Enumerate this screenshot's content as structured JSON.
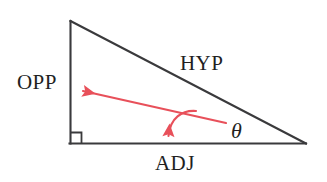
{
  "diagram": {
    "kind": "right-triangle-trigonometry-diagram",
    "background_color": "#ffffff",
    "stroke_color": "#3a3a3c",
    "annotation_color": "#e8505a",
    "labels": {
      "opposite": "OPP",
      "hypotenuse": "HYP",
      "adjacent": "ADJ",
      "angle": "θ"
    },
    "vertices": {
      "apex": [
        70,
        21
      ],
      "right_angle_corner": [
        70,
        143
      ],
      "far_corner": [
        306,
        143
      ]
    },
    "right_angle_marker": {
      "size": 11,
      "shown": true
    },
    "annotations": [
      {
        "name": "opposite-pointer-arrow",
        "color": "#e8505a",
        "from": [
          226,
          123
        ],
        "to": [
          78,
          90
        ]
      },
      {
        "name": "adjacent-pointer-arc-arrow",
        "color": "#e8505a",
        "from": [
          196,
          111
        ],
        "to": [
          168,
          144
        ]
      }
    ]
  }
}
